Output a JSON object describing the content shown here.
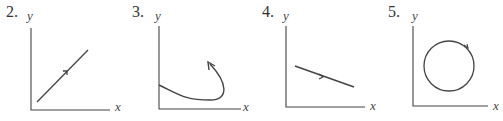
{
  "figures": [
    {
      "number": "2.",
      "y_label": "y",
      "x_label": "x",
      "curve": "straight line increasing from lower-left to upper-right with direction arrow"
    },
    {
      "number": "3.",
      "y_label": "y",
      "x_label": "x",
      "curve": "curve starting on y-axis, dipping down and hooking upward with arrowhead"
    },
    {
      "number": "4.",
      "y_label": "y",
      "x_label": "x",
      "curve": "straight line decreasing left to right with direction arrow"
    },
    {
      "number": "5.",
      "y_label": "y",
      "x_label": "x",
      "curve": "closed circle with direction arrow"
    }
  ],
  "colors": {
    "ink": "#444444",
    "background": "#ffffff"
  }
}
